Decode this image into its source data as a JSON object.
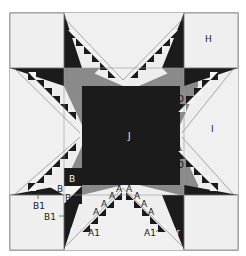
{
  "diagram": {
    "colors": {
      "background": "#eeeeee",
      "dark": "#1b1b1b",
      "medium": "#8a8a8a",
      "light": "#f4f4f4",
      "outline": "#777777"
    },
    "labels": {
      "H": "H",
      "I": "I",
      "J": "J",
      "D_top": "D",
      "D_bottom": "D",
      "B_outer": "B",
      "B_inner": "B",
      "B_lower": "B",
      "B1_left": "B1",
      "B1_lower": "B1",
      "C": "C",
      "Cr": "Cr",
      "A1_left": "A1",
      "A1_right": "A1",
      "A_list": [
        "A",
        "A",
        "A",
        "A",
        "A",
        "A",
        "A",
        "A"
      ]
    }
  }
}
